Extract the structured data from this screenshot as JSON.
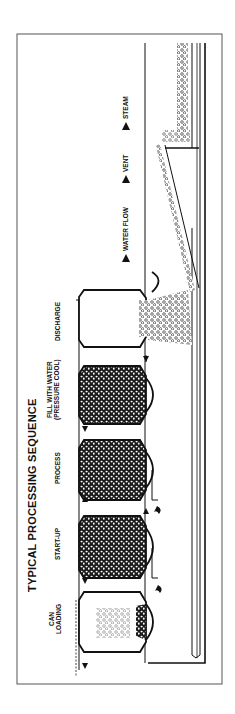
{
  "diagram": {
    "title": "TYPICAL PROCESSING SEQUENCE",
    "steps": [
      {
        "line1": "CAN",
        "line2": "LOADING",
        "fill": "partial"
      },
      {
        "line1": "START-UP",
        "line2": "",
        "fill": "full"
      },
      {
        "line1": "PROCESS",
        "line2": "",
        "fill": "full"
      },
      {
        "line1": "FILL WITH WATER",
        "line2": "(PRESSURE COOL)",
        "fill": "full"
      },
      {
        "line1": "DISCHARGE",
        "line2": "",
        "fill": "discharging"
      }
    ],
    "legend": [
      {
        "label": "WATER FLOW",
        "icon": "triangle-arrow"
      },
      {
        "label": "VENT",
        "icon": "triangle-arrow"
      },
      {
        "label": "STEAM",
        "icon": "triangle-arrow"
      }
    ],
    "colors": {
      "ink": "#111111",
      "background": "#ffffff",
      "frame": "#444444"
    },
    "orientation": "rotated -90deg"
  }
}
